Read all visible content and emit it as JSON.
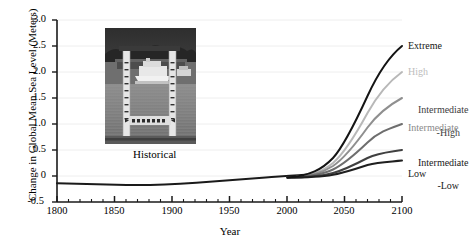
{
  "chart_data": {
    "type": "line",
    "title": "",
    "xlabel": "Year",
    "ylabel": "Change in Global Mean Sea Level (Meters)",
    "xlim": [
      1800,
      2100
    ],
    "ylim": [
      -0.5,
      3.0
    ],
    "xticks": [
      1800,
      1850,
      1900,
      1950,
      2000,
      2050,
      2100
    ],
    "xticklabels": [
      "1800",
      "1850",
      "1900",
      "1950",
      "2000",
      "2050",
      "2100"
    ],
    "yticks": [
      -0.5,
      0,
      0.5,
      1.0,
      1.5,
      2.0,
      2.5,
      3.0
    ],
    "yticklabels": [
      "-0.5",
      "0",
      "0.5",
      "1.0",
      "1.5",
      "2.0",
      "2.5",
      "3.0"
    ],
    "minor_xtick_interval": 10,
    "grid": true,
    "legend_position": "right-inline-labels",
    "annotations": [
      {
        "text": "Historical",
        "x": 1880,
        "y": 0.18
      }
    ],
    "historical": {
      "name": "Historical",
      "color": "#1a1a1a",
      "x": [
        1800,
        1820,
        1840,
        1860,
        1880,
        1900,
        1920,
        1940,
        1960,
        1980,
        2000,
        2020
      ],
      "y": [
        -0.155,
        -0.158,
        -0.162,
        -0.168,
        -0.172,
        -0.168,
        -0.148,
        -0.118,
        -0.09,
        -0.062,
        -0.03,
        0.01
      ]
    },
    "series": [
      {
        "name": "Extreme",
        "label": "Extreme",
        "color": "#141414",
        "value_2100": 2.5,
        "x": [
          2000,
          2020,
          2040,
          2060,
          2080,
          2100
        ],
        "y": [
          -0.03,
          0.05,
          0.38,
          0.95,
          1.7,
          2.5
        ]
      },
      {
        "name": "High",
        "label": "High",
        "color": "#b8b8b8",
        "value_2100": 2.0,
        "x": [
          2000,
          2020,
          2040,
          2060,
          2080,
          2100
        ],
        "y": [
          -0.03,
          0.04,
          0.3,
          0.76,
          1.35,
          2.0
        ]
      },
      {
        "name": "Intermediate-High",
        "label": "Intermediate\n      -High",
        "color": "#8f8f8f",
        "value_2100": 1.5,
        "x": [
          2000,
          2020,
          2040,
          2060,
          2080,
          2100
        ],
        "y": [
          -0.03,
          0.04,
          0.24,
          0.58,
          1.0,
          1.5
        ]
      },
      {
        "name": "Intermediate",
        "label": "Intermediate",
        "color": "#6e6e6e",
        "value_2100": 1.0,
        "x": [
          2000,
          2020,
          2040,
          2060,
          2080,
          2100
        ],
        "y": [
          -0.03,
          0.03,
          0.17,
          0.4,
          0.68,
          1.0
        ]
      },
      {
        "name": "Intermediate-Low",
        "label": "Intermediate\n      -Low",
        "color": "#404040",
        "value_2100": 0.5,
        "x": [
          2000,
          2020,
          2040,
          2060,
          2080,
          2100
        ],
        "y": [
          -0.03,
          0.02,
          0.1,
          0.22,
          0.35,
          0.5
        ]
      },
      {
        "name": "Low",
        "label": "Low",
        "color": "#1f1f1f",
        "value_2100": 0.3,
        "x": [
          2000,
          2020,
          2040,
          2060,
          2080,
          2100
        ],
        "y": [
          -0.03,
          0.01,
          0.06,
          0.14,
          0.22,
          0.3
        ]
      }
    ]
  },
  "labels": {
    "y_axis_title": "Change in Global Mean Sea Level (Meters)",
    "x_axis_title": "Year",
    "historical": "Historical",
    "extreme": "Extreme",
    "high": "High",
    "intermediate_high_line1": "Intermediate",
    "intermediate_high_line2": "-High",
    "intermediate": "Intermediate",
    "intermediate_low_line1": "Intermediate",
    "intermediate_low_line2": "-Low",
    "low": "Low"
  },
  "yticklabels": {
    "t0": "3.0",
    "t1": "2.5",
    "t2": "2.0",
    "t3": "1.5",
    "t4": "1.0",
    "t5": "0.5",
    "t6": "0",
    "t7": "-0.5"
  },
  "xticklabels": {
    "t0": "1800",
    "t1": "1850",
    "t2": "1900",
    "t3": "1950",
    "t4": "2000",
    "t5": "2050",
    "t6": "2100"
  },
  "inset": {
    "name": "tide-gauge-photo",
    "alt": "Grayscale photograph of a tide gauge staff with water level markings in front of a dock and boat"
  },
  "colors": {
    "axis": "#1a1a1a",
    "grid": "#eeeeee",
    "background": "#ffffff",
    "text": "#000000"
  }
}
